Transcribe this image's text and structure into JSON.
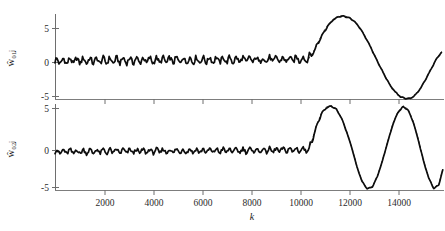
{
  "figure": {
    "background_color": "#ffffff",
    "axis_color": "#7d7d7d",
    "trace_color": "#0d0d0d",
    "xlabel": "k",
    "panels": [
      {
        "id": "panel-top",
        "ylabel": "ŵ₀₁ⱼ",
        "yticks": [
          "5",
          "0",
          "-5"
        ]
      },
      {
        "id": "panel-bottom",
        "ylabel": "ŵ₀₂ⱼ",
        "yticks": [
          "5",
          "0",
          "-5"
        ]
      }
    ],
    "xticks": [
      "2000",
      "4000",
      "6000",
      "8000",
      "10000",
      "12000",
      "14000"
    ]
  },
  "chart_data": [
    {
      "type": "line",
      "id": "panel-top",
      "title": "",
      "xlabel": "k",
      "ylabel": "w-hat_01j",
      "xlim": [
        0,
        15200
      ],
      "ylim": [
        -5,
        6.3
      ],
      "yticks": [
        5,
        0,
        -5
      ],
      "xticks": [
        2000,
        4000,
        6000,
        8000,
        10000,
        12000,
        14000
      ],
      "grid": false,
      "legend": null,
      "series": [
        {
          "name": "estimate (solid, noisy)",
          "style": "solid",
          "noise_amplitude": 0.6,
          "noise_ripple_period": 260,
          "x": [
            0,
            500,
            1000,
            1500,
            2000,
            2500,
            3000,
            3500,
            4000,
            4500,
            5000,
            5500,
            6000,
            6500,
            7000,
            7500,
            8000,
            8500,
            9000,
            9500,
            9900,
            10100,
            10300,
            10500,
            10700,
            10900,
            11100,
            11300,
            11500,
            11700,
            11900,
            12100,
            12300,
            12500,
            12700,
            12900,
            13100,
            13300,
            13500,
            13700,
            13900,
            14100,
            14300,
            14500,
            14700,
            14900,
            15100
          ],
          "y": [
            0.0,
            0.05,
            0.1,
            0.1,
            0.1,
            0.12,
            0.12,
            0.15,
            0.15,
            0.15,
            0.18,
            0.18,
            0.2,
            0.2,
            0.2,
            0.22,
            0.22,
            0.25,
            0.25,
            0.3,
            0.35,
            1.2,
            2.6,
            3.9,
            4.9,
            5.6,
            5.95,
            6.0,
            5.8,
            5.3,
            4.5,
            3.4,
            2.1,
            0.7,
            -0.7,
            -2.0,
            -3.2,
            -4.1,
            -4.7,
            -4.95,
            -4.9,
            -4.4,
            -3.5,
            -2.3,
            -1.0,
            0.3,
            1.2
          ]
        },
        {
          "name": "reference (dashed, smooth)",
          "style": "dashed",
          "x": [
            9900,
            10100,
            10300,
            10500,
            10700,
            10900,
            11100,
            11300,
            11500,
            11700,
            11900,
            12100,
            12300,
            12500,
            12700,
            12900,
            13100,
            13300,
            13500,
            13700,
            13900,
            14100,
            14300,
            14500,
            14700,
            14900,
            15100
          ],
          "y": [
            0.3,
            1.3,
            2.7,
            4.0,
            5.0,
            5.7,
            6.05,
            6.05,
            5.85,
            5.35,
            4.55,
            3.45,
            2.15,
            0.75,
            -0.65,
            -1.95,
            -3.15,
            -4.05,
            -4.65,
            -4.95,
            -4.9,
            -4.4,
            -3.5,
            -2.3,
            -1.0,
            0.35,
            1.3
          ]
        }
      ]
    },
    {
      "type": "line",
      "id": "panel-bottom",
      "title": "",
      "xlabel": "k",
      "ylabel": "w-hat_02j",
      "xlim": [
        0,
        15200
      ],
      "ylim": [
        -5,
        6.3
      ],
      "yticks": [
        5,
        0,
        -5
      ],
      "xticks": [
        2000,
        4000,
        6000,
        8000,
        10000,
        12000,
        14000
      ],
      "grid": false,
      "legend": null,
      "series": [
        {
          "name": "estimate (solid, noisy)",
          "style": "solid",
          "noise_amplitude": 0.45,
          "noise_ripple_period": 260,
          "x": [
            0,
            500,
            1000,
            1500,
            2000,
            2500,
            3000,
            3500,
            4000,
            4500,
            5000,
            5500,
            6000,
            6500,
            7000,
            7500,
            8000,
            8500,
            9000,
            9500,
            9900,
            10050,
            10200,
            10400,
            10600,
            10800,
            11000,
            11200,
            11400,
            11600,
            11800,
            12000,
            12200,
            12400,
            12600,
            12800,
            13000,
            13200,
            13400,
            13600,
            13800,
            14000,
            14200,
            14400,
            14600,
            14800,
            15000,
            15150
          ],
          "y": [
            0.0,
            0.05,
            0.05,
            0.08,
            0.08,
            0.1,
            0.1,
            0.1,
            0.12,
            0.12,
            0.15,
            0.15,
            0.15,
            0.18,
            0.18,
            0.2,
            0.2,
            0.22,
            0.25,
            0.28,
            0.3,
            1.5,
            3.2,
            4.9,
            5.8,
            6.0,
            5.6,
            4.4,
            2.6,
            0.5,
            -2.0,
            -3.9,
            -4.85,
            -4.6,
            -3.2,
            -1.1,
            1.3,
            3.6,
            5.2,
            5.95,
            5.5,
            3.9,
            1.5,
            -1.2,
            -3.4,
            -4.8,
            -4.3,
            -2.4
          ]
        },
        {
          "name": "reference (dashed, smooth)",
          "style": "dashed",
          "x": [
            9900,
            10050,
            10200,
            10400,
            10600,
            10800,
            11000,
            11200,
            11400,
            11600,
            11800,
            12000,
            12200,
            12400,
            12600,
            12800,
            13000,
            13200,
            13400,
            13600,
            13800,
            14000,
            14200,
            14400,
            14600,
            14800,
            15000,
            15150
          ],
          "y": [
            0.3,
            1.6,
            3.3,
            5.0,
            5.9,
            6.1,
            5.65,
            4.45,
            2.65,
            0.55,
            -1.95,
            -3.85,
            -4.8,
            -4.55,
            -3.15,
            -1.05,
            1.35,
            3.7,
            5.3,
            6.05,
            5.6,
            4.0,
            1.6,
            -1.15,
            -3.35,
            -4.75,
            -4.25,
            -2.3
          ]
        }
      ]
    }
  ]
}
